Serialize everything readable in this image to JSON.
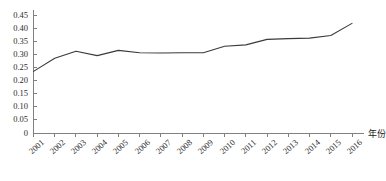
{
  "chart_data": {
    "type": "line",
    "title": "",
    "subtitle": "",
    "xlabel": "年份",
    "ylabel": "",
    "categories": [
      "2001",
      "2002",
      "2003",
      "2004",
      "2005",
      "2006",
      "2007",
      "2008",
      "2009",
      "2010",
      "2011",
      "2012",
      "2013",
      "2014",
      "2015",
      "2016"
    ],
    "values": [
      0.235,
      0.285,
      0.312,
      0.295,
      0.315,
      0.306,
      0.305,
      0.306,
      0.306,
      0.331,
      0.336,
      0.357,
      0.36,
      0.362,
      0.372,
      0.418
    ],
    "series": [
      {
        "name": "",
        "values": [
          0.235,
          0.285,
          0.312,
          0.295,
          0.315,
          0.306,
          0.305,
          0.306,
          0.306,
          0.331,
          0.336,
          0.357,
          0.36,
          0.362,
          0.372,
          0.418
        ]
      }
    ],
    "ylim": [
      0,
      0.45
    ],
    "ytick_labels": [
      "0",
      "0.05",
      "0.10",
      "0.15",
      "0.20",
      "0.25",
      "0.30",
      "0.35",
      "0.40",
      "0.45"
    ],
    "ytick_values": [
      0,
      0.05,
      0.1,
      0.15,
      0.2,
      0.25,
      0.3,
      0.35,
      0.4,
      0.45
    ],
    "grid": false,
    "legend": "none",
    "line_color": "#3a3a3a",
    "axis_color": "#808080",
    "markers": false
  }
}
